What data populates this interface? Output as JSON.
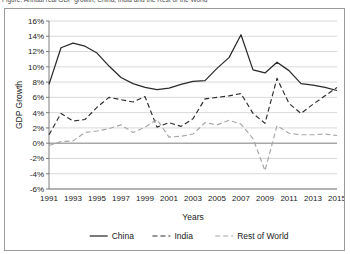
{
  "caption": {
    "text": "Figure: Annual real GDP growth, China, India and the Rest of the World"
  },
  "chart_data": {
    "type": "line",
    "title": "",
    "xlabel": "Years",
    "ylabel": "GDP Growth",
    "x": [
      1991,
      1992,
      1993,
      1994,
      1995,
      1996,
      1997,
      1998,
      1999,
      2000,
      2001,
      2002,
      2003,
      2004,
      2005,
      2006,
      2007,
      2008,
      2009,
      2010,
      2011,
      2012,
      2013,
      2014,
      2015
    ],
    "xlim": [
      1991,
      2015
    ],
    "ylim": [
      -6,
      16
    ],
    "ytick_step": 2,
    "xtick_step": 2,
    "ytick_labels": [
      "16%",
      "14%",
      "12%",
      "10%",
      "8%",
      "6%",
      "4%",
      "2%",
      "0%",
      "-2%",
      "-4%",
      "-6%"
    ],
    "xtick_labels": [
      "1991",
      "1993",
      "1995",
      "1997",
      "1999",
      "2001",
      "2003",
      "2005",
      "2007",
      "2009",
      "2011",
      "2013",
      "2015"
    ],
    "grid": "horizontal",
    "legend_position": "bottom",
    "series": [
      {
        "name": "China",
        "style": "solid",
        "color": "#2b2b2b",
        "values": [
          7.7,
          12.5,
          13.1,
          12.7,
          11.8,
          10.1,
          8.6,
          7.8,
          7.3,
          7.0,
          7.2,
          7.7,
          8.1,
          8.2,
          9.8,
          11.2,
          14.2,
          9.6,
          9.2,
          10.6,
          9.5,
          7.8,
          7.6,
          7.3,
          6.9
        ]
      },
      {
        "name": "India",
        "style": "dashed",
        "color": "#2b2b2b",
        "values": [
          1.1,
          3.9,
          2.9,
          3.1,
          4.7,
          6.0,
          5.7,
          5.4,
          6.1,
          2.1,
          2.7,
          2.2,
          3.2,
          5.8,
          6.0,
          6.2,
          6.5,
          3.9,
          2.6,
          8.5,
          5.2,
          3.9,
          5.1,
          6.2,
          7.3
        ]
      },
      {
        "name": "Rest of World",
        "style": "dashed",
        "color": "#a6a6a6",
        "values": [
          -0.3,
          0.2,
          0.3,
          1.4,
          1.6,
          1.9,
          2.4,
          1.4,
          2.1,
          3.1,
          0.8,
          0.9,
          1.2,
          2.7,
          2.4,
          3.0,
          2.5,
          0.6,
          -3.6,
          2.3,
          1.3,
          1.1,
          1.1,
          1.2,
          1.0
        ]
      }
    ]
  },
  "legend": {
    "items": [
      {
        "label": "China"
      },
      {
        "label": "India"
      },
      {
        "label": "Rest of World"
      }
    ]
  }
}
